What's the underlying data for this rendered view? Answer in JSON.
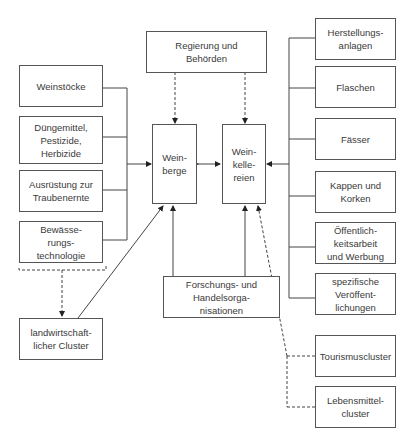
{
  "diagram": {
    "title": "",
    "nodes": {
      "regierung": {
        "label": "Regierung und\nBehörden"
      },
      "weinstoecke": {
        "label": "Weinstöcke"
      },
      "duengemittel": {
        "label": "Düngemittel,\nPestizide,\nHerbizide"
      },
      "ausruestung": {
        "label": "Ausrüstung zur\nTraubenernte"
      },
      "bewaesserung": {
        "label": "Bewässe-\nrungs-\ntechnologie"
      },
      "weinberge": {
        "label": "Wein-\nberge"
      },
      "weinkellereien": {
        "label": "Wein-\nkelle-\nreien"
      },
      "herstellung": {
        "label": "Herstellungs-\nanlagen"
      },
      "flaschen": {
        "label": "Flaschen"
      },
      "faesser": {
        "label": "Fässer"
      },
      "kappen": {
        "label": "Kappen und\nKorken"
      },
      "oeffentlichkeit": {
        "label": "Öffentlich-\nkeitsarbeit\nund Werbung"
      },
      "veroeffentlichungen": {
        "label": "spezifische\nVeröffent-\nlichungen"
      },
      "forschung": {
        "label": "Forschungs- und\nHandelsorga-\nnisationen"
      },
      "landwirtschaft": {
        "label": "landwirtschaft-\nlicher Cluster"
      },
      "tourismus": {
        "label": "Tourismuscluster"
      },
      "lebensmittel": {
        "label": "Lebensmittel-\ncluster"
      }
    },
    "edges": [
      {
        "from": "regierung",
        "to": "weinberge",
        "style": "dashed"
      },
      {
        "from": "regierung",
        "to": "weinkellereien",
        "style": "dashed"
      },
      {
        "from": "left-supplier-group",
        "to": "weinberge",
        "style": "solid"
      },
      {
        "from": "weinberge",
        "to": "weinkellereien",
        "style": "solid",
        "bidirectional": true
      },
      {
        "from": "right-supplier-group",
        "to": "weinkellereien",
        "style": "solid"
      },
      {
        "from": "forschung",
        "to": "weinberge",
        "style": "solid"
      },
      {
        "from": "forschung",
        "to": "weinkellereien",
        "style": "solid"
      },
      {
        "from": "landwirtschaft",
        "to": "weinberge",
        "style": "solid"
      },
      {
        "from": "left-supplier-group",
        "to": "landwirtschaft",
        "style": "dashed"
      },
      {
        "from": "tourismus-lebensmittel-group",
        "to": "weinkellereien",
        "style": "dashed"
      }
    ],
    "colors": {
      "line": "#444444",
      "border": "#555555",
      "text": "#3a3a3a",
      "background": "#ffffff"
    }
  }
}
